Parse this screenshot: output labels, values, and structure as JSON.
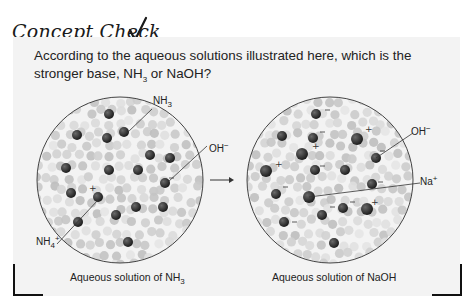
{
  "header": {
    "title": "Concept Check",
    "check_icon": "checkmark-icon"
  },
  "question": {
    "text_part1": "According to the aqueous solutions illustrated here, which is the stronger base, NH",
    "sub": "3",
    "text_part2": " or NaOH?"
  },
  "left_solution": {
    "caption_prefix": "Aqueous solution of NH",
    "caption_sub": "3",
    "labels": {
      "nh3": {
        "base": "NH",
        "sub": "3"
      },
      "oh": {
        "base": "OH",
        "sup": "−"
      },
      "nh4": {
        "base": "NH",
        "sub": "4",
        "sup": "+"
      }
    }
  },
  "right_solution": {
    "caption": "Aqueous solution of NaOH",
    "labels": {
      "oh": {
        "base": "OH",
        "sup": "−"
      },
      "na": {
        "base": "Na",
        "sup": "+"
      }
    }
  },
  "arrow": "right-arrow-icon",
  "colors": {
    "panel": "#f3f3f3",
    "water": "#c8c8c8",
    "solute": "#3a3a3a",
    "circle_border": "#444444"
  }
}
